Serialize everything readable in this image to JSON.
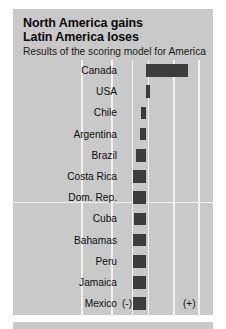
{
  "figure": {
    "title_lines": [
      "North America gains",
      "Latin America loses"
    ],
    "subtitle": "Results of the scoring model for America",
    "axis_marker_negative": "(-)",
    "axis_marker_positive": "(+)",
    "colors": {
      "panel_background": "#c9c9c9",
      "bar": "#3c3c3c",
      "gridline": "#f2f2f2",
      "text": "#101010",
      "page_background": "#ffffff"
    }
  },
  "chart_data": {
    "type": "bar",
    "orientation": "horizontal",
    "title": "North America gains Latin America loses",
    "subtitle": "Results of the scoring model for America",
    "xlabel": "",
    "ylabel": "",
    "xlim": [
      -1.0,
      1.0
    ],
    "grid": true,
    "legend": null,
    "annotations": [
      "(-)",
      "(+)"
    ],
    "categories": [
      "Canada",
      "USA",
      "Chile",
      "Argentina",
      "Brazil",
      "Costa Rica",
      "Dom. Rep.",
      "Cuba",
      "Bahamas",
      "Peru",
      "Jamaica",
      "Mexico"
    ],
    "values": [
      0.72,
      0.06,
      -0.08,
      -0.1,
      -0.17,
      -0.21,
      -0.21,
      -0.2,
      -0.21,
      -0.21,
      -0.21,
      -0.22
    ]
  },
  "rows": [
    {
      "label": "Canada",
      "value": 0.72,
      "bar_left": 133.0,
      "bar_width": 42.0
    },
    {
      "label": "USA",
      "value": 0.06,
      "bar_left": 133.0,
      "bar_width": 3.5
    },
    {
      "label": "Chile",
      "value": -0.08,
      "bar_left": 128.0,
      "bar_width": 5.0
    },
    {
      "label": "Argentina",
      "value": -0.1,
      "bar_left": 127.0,
      "bar_width": 6.0
    },
    {
      "label": "Brazil",
      "value": -0.17,
      "bar_left": 122.5,
      "bar_width": 10.5
    },
    {
      "label": "Costa Rica",
      "value": -0.21,
      "bar_left": 120.0,
      "bar_width": 13.0
    },
    {
      "label": "Dom. Rep.",
      "value": -0.21,
      "bar_left": 120.0,
      "bar_width": 13.0
    },
    {
      "label": "Cuba",
      "value": -0.2,
      "bar_left": 120.5,
      "bar_width": 12.5
    },
    {
      "label": "Bahamas",
      "value": -0.21,
      "bar_left": 120.0,
      "bar_width": 13.0
    },
    {
      "label": "Peru",
      "value": -0.21,
      "bar_left": 120.0,
      "bar_width": 13.0
    },
    {
      "label": "Jamaica",
      "value": -0.21,
      "bar_left": 120.0,
      "bar_width": 13.0
    },
    {
      "label": "Mexico",
      "value": -0.22,
      "bar_left": 119.5,
      "bar_width": 13.5
    }
  ],
  "gridlines": {
    "vertical_x": [
      68.0,
      98.0,
      118.5,
      134.5,
      160.0,
      185.0
    ],
    "horizontal_y": [
      142.0
    ]
  }
}
